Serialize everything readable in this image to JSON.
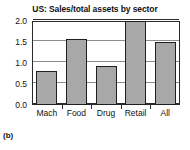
{
  "panel": {
    "caption": "(b)"
  },
  "chart_data": {
    "type": "bar",
    "title": "US: Sales/total assets by sector",
    "xlabel": "",
    "ylabel": "",
    "categories": [
      "Mach",
      "Food",
      "Drug",
      "Retail",
      "All"
    ],
    "values": [
      0.8,
      1.57,
      0.92,
      2.0,
      1.51
    ],
    "series": [
      {
        "name": "Sales/total assets",
        "values": [
          0.8,
          1.57,
          0.92,
          2.0,
          1.51
        ]
      }
    ],
    "ylim": [
      0.0,
      2.0
    ],
    "yticks": [
      0.0,
      0.5,
      1.0,
      1.5,
      2.0
    ],
    "ytick_labels": [
      "0.0",
      "0.5",
      "1.0",
      "1.5",
      "2.0"
    ],
    "grid": true,
    "grid_axis": "y",
    "legend": false,
    "legend_position": "none",
    "bar_fill_color": "#a8a8a8",
    "bar_edge_color": "#1f1f1f",
    "axis_color": "#2b2b2b",
    "gridline_color": "#8d8d8d",
    "background_color": "#ffffff"
  }
}
